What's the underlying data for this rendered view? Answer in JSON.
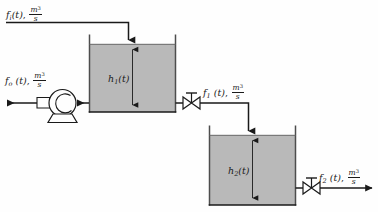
{
  "diagram": {
    "type": "process-flow-schematic",
    "colors": {
      "liquid_fill": "#b9b9b9",
      "line": "#1a1a1a",
      "background": "#fefefe",
      "tank_wall": "#4d4d4d"
    }
  },
  "streams": {
    "inlet": {
      "symbol": "f",
      "subscript": "i",
      "arg": "(t)",
      "separator": ",",
      "unit_numerator": "m",
      "unit_exponent": "3",
      "unit_denominator": "s",
      "text": "f_i(t), m^3/s",
      "direction": "into-tank-1"
    },
    "pump_outlet": {
      "symbol": "f",
      "subscript": "o",
      "arg": "(t)",
      "separator": ",",
      "unit_numerator": "m",
      "unit_exponent": "3",
      "unit_denominator": "s",
      "text": "f_o(t), m^3/s",
      "direction": "out-left"
    },
    "tank1_outlet": {
      "symbol": "f",
      "subscript": "1",
      "arg": "(t)",
      "separator": ",",
      "unit_numerator": "m",
      "unit_exponent": "3",
      "unit_denominator": "s",
      "text": "f_1(t), m^3/s",
      "direction": "tank-1-to-tank-2"
    },
    "tank2_outlet": {
      "symbol": "f",
      "subscript": "2",
      "arg": "(t)",
      "separator": ",",
      "unit_numerator": "m",
      "unit_exponent": "3",
      "unit_denominator": "s",
      "text": "f_2(t), m^3/s",
      "direction": "out-right"
    }
  },
  "tanks": [
    {
      "id": "tank-1",
      "level_symbol": "h",
      "level_subscript": "1",
      "level_arg": "(t)",
      "level_text": "h_1(t)"
    },
    {
      "id": "tank-2",
      "level_symbol": "h",
      "level_subscript": "2",
      "level_arg": "(t)",
      "level_text": "h_2(t)"
    }
  ],
  "equipment": [
    {
      "id": "pump",
      "name": "centrifugal-pump"
    },
    {
      "id": "valve-1",
      "name": "valve"
    },
    {
      "id": "valve-2",
      "name": "valve"
    }
  ]
}
